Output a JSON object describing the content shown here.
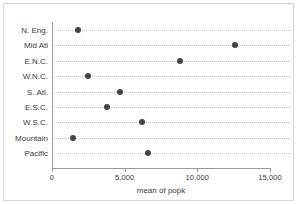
{
  "chart_data": {
    "type": "scatter",
    "title": "",
    "xlabel": "mean of popk",
    "ylabel": "",
    "xlim": [
      0,
      15000
    ],
    "xticks": [
      0,
      5000,
      10000,
      15000
    ],
    "xticklabels": [
      "0",
      "5,000",
      "10,000",
      "15,000"
    ],
    "grid": true,
    "grid_orientation": "horizontal",
    "grid_style": "dotted",
    "legend": "none",
    "marker": "filled-circle",
    "marker_color": "#454545",
    "categories": [
      "N. Eng.",
      "Mid Atl",
      "E.N.C.",
      "W.N.C.",
      "S. Atl.",
      "E.S.C.",
      "W.S.C.",
      "Mountain",
      "Pacific"
    ],
    "values": [
      1800,
      12600,
      8800,
      2500,
      4700,
      3800,
      6200,
      1450,
      6600
    ],
    "points": [
      {
        "category": "N. Eng.",
        "value": 1800
      },
      {
        "category": "Mid Atl",
        "value": 12600
      },
      {
        "category": "E.N.C.",
        "value": 8800
      },
      {
        "category": "W.N.C.",
        "value": 2500
      },
      {
        "category": "S. Atl.",
        "value": 4700
      },
      {
        "category": "E.S.C.",
        "value": 3800
      },
      {
        "category": "W.S.C.",
        "value": 6200
      },
      {
        "category": "Mountain",
        "value": 1450
      },
      {
        "category": "Pacific",
        "value": 6600
      }
    ]
  },
  "axes": {
    "x_title": "mean of popk"
  },
  "colors": {
    "marker": "#454545",
    "grid": "#c9c9c9",
    "spine": "#9a9a9a",
    "frame": "#d7d7d7",
    "text": "#3a3a3a",
    "background": "#ffffff"
  }
}
